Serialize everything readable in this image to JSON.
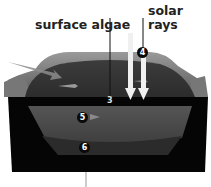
{
  "labels": {
    "surface_algae": "surface algae",
    "solar_line1": "solar",
    "solar_line2": "rays"
  },
  "markers": {
    "m3": "3",
    "m4": "4",
    "m5": "5",
    "m6": "6"
  },
  "colors": {
    "background": "#ffffff",
    "container": "#050505",
    "water_surface": "#3a3a3a",
    "rim": "#8a8a8a",
    "layer5": "#4a4a4a",
    "layer6": "#2a2a2a",
    "rays": "#f2f2f2"
  }
}
